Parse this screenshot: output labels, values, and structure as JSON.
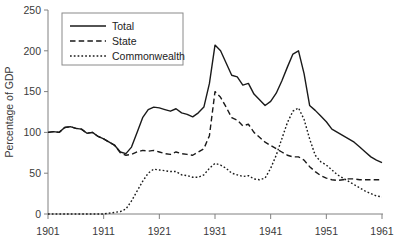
{
  "chart_data": {
    "type": "line",
    "title": "",
    "xlabel": "",
    "ylabel": "Percentage of GDP",
    "xlim": [
      1901,
      1961
    ],
    "ylim": [
      0,
      250
    ],
    "yticks": [
      0,
      50,
      100,
      150,
      200,
      250
    ],
    "xticks": [
      1901,
      1911,
      1921,
      1931,
      1941,
      1951,
      1961
    ],
    "grid": false,
    "legend_position": "top-left",
    "x": [
      1901,
      1902,
      1903,
      1904,
      1905,
      1906,
      1907,
      1908,
      1909,
      1910,
      1911,
      1912,
      1913,
      1914,
      1915,
      1916,
      1917,
      1918,
      1919,
      1920,
      1921,
      1922,
      1923,
      1924,
      1925,
      1926,
      1927,
      1928,
      1929,
      1930,
      1931,
      1932,
      1933,
      1934,
      1935,
      1936,
      1937,
      1938,
      1939,
      1940,
      1941,
      1942,
      1943,
      1944,
      1945,
      1946,
      1947,
      1948,
      1949,
      1950,
      1951,
      1952,
      1953,
      1954,
      1955,
      1956,
      1957,
      1958,
      1959,
      1960,
      1961
    ],
    "series": [
      {
        "name": "Total",
        "style": "solid",
        "values": [
          100,
          101,
          100,
          106,
          107,
          105,
          104,
          99,
          100,
          95,
          92,
          88,
          84,
          76,
          74,
          82,
          100,
          118,
          128,
          131,
          130,
          128,
          126,
          129,
          124,
          122,
          119,
          124,
          131,
          160,
          207,
          200,
          185,
          170,
          168,
          158,
          160,
          147,
          140,
          133,
          138,
          148,
          163,
          180,
          196,
          200,
          172,
          133,
          127,
          120,
          113,
          104,
          100,
          96,
          92,
          88,
          82,
          76,
          70,
          66,
          63
        ]
      },
      {
        "name": "State",
        "style": "dashed",
        "values": [
          100,
          101,
          100,
          106,
          107,
          105,
          104,
          99,
          100,
          95,
          92,
          88,
          84,
          75,
          72,
          73,
          76,
          78,
          77,
          78,
          76,
          74,
          73,
          76,
          74,
          73,
          72,
          76,
          80,
          96,
          150,
          143,
          131,
          118,
          115,
          108,
          110,
          100,
          94,
          88,
          84,
          80,
          76,
          72,
          70,
          70,
          66,
          58,
          52,
          47,
          44,
          42,
          41,
          42,
          43,
          43,
          42,
          42,
          42,
          42,
          42
        ]
      },
      {
        "name": "Commonwealth",
        "style": "dotted",
        "values": [
          0,
          0,
          0,
          0,
          0,
          0,
          0,
          0,
          0,
          0,
          0,
          1,
          2,
          3,
          6,
          16,
          28,
          40,
          50,
          55,
          54,
          53,
          52,
          52,
          48,
          47,
          45,
          45,
          48,
          56,
          62,
          60,
          56,
          50,
          48,
          46,
          47,
          43,
          42,
          44,
          56,
          72,
          92,
          112,
          126,
          130,
          116,
          92,
          72,
          64,
          60,
          54,
          48,
          44,
          40,
          36,
          32,
          28,
          25,
          22,
          21
        ]
      }
    ]
  },
  "legend": {
    "items": [
      {
        "label": "Total",
        "style": "solid"
      },
      {
        "label": "State",
        "style": "dashed"
      },
      {
        "label": "Commonwealth",
        "style": "dotted"
      }
    ]
  },
  "axes": {
    "y_label": "Percentage of GDP",
    "y_tick_labels": [
      "250",
      "200",
      "150",
      "100",
      "50",
      "0"
    ],
    "x_tick_labels": [
      "1901",
      "1911",
      "1921",
      "1931",
      "1941",
      "1951",
      "1961"
    ]
  }
}
